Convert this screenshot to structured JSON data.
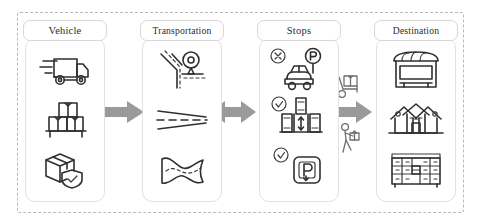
{
  "diagram": {
    "frame_style": "dashed",
    "colors": {
      "frame_border": "#b9b9b9",
      "card_border": "#e2e2e2",
      "label_border": "#d8d8d8",
      "arrow": "#9a9a9a",
      "icon_stroke": "#2f2f2f",
      "background": "#ffffff"
    },
    "columns": [
      {
        "id": "vehicle",
        "label": "Vehicle",
        "icons": [
          {
            "name": "delivery-truck-icon",
            "caption": "Delivery truck"
          },
          {
            "name": "pallet-boxes-icon",
            "caption": "Stacked boxes on pallet"
          },
          {
            "name": "secure-package-icon",
            "caption": "Package with shield"
          }
        ]
      },
      {
        "id": "transportation",
        "label": "Transportation",
        "icons": [
          {
            "name": "road-junction-pin-icon",
            "caption": "Road junction with location pin"
          },
          {
            "name": "road-lane-lines-icon",
            "caption": "Road lane markings"
          },
          {
            "name": "winding-road-icon",
            "caption": "Winding road"
          }
        ]
      },
      {
        "id": "stops",
        "label": "Stops",
        "icons": [
          {
            "name": "no-parking-car-icon",
            "caption": "Car with parking sign, not allowed"
          },
          {
            "name": "parking-spaces-icon",
            "caption": "Parking spaces, allowed"
          },
          {
            "name": "parking-sign-icon",
            "caption": "Parking sign, allowed"
          }
        ]
      },
      {
        "id": "destination",
        "label": "Destination",
        "icons": [
          {
            "name": "storefront-icon",
            "caption": "Store front"
          },
          {
            "name": "houses-icon",
            "caption": "Residential houses"
          },
          {
            "name": "parcel-lockers-icon",
            "caption": "Parcel locker bank"
          }
        ]
      }
    ],
    "arrows": [
      {
        "name": "arrow-vehicle-to-transportation",
        "direction": "right"
      },
      {
        "name": "arrow-transportation-stops",
        "direction": "both"
      },
      {
        "name": "arrow-stops-destination",
        "direction": "both"
      }
    ],
    "connector_icons": [
      {
        "name": "hand-truck-icon",
        "caption": "Hand truck with boxes"
      },
      {
        "name": "courier-walking-icon",
        "caption": "Courier carrying package"
      }
    ]
  }
}
